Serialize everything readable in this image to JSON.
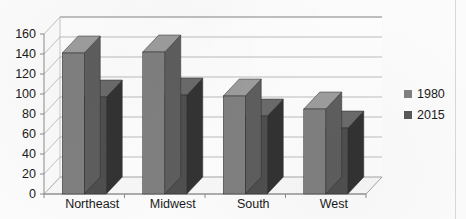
{
  "chart_data": {
    "type": "bar",
    "style": "3d-clustered-column",
    "title": "",
    "subtitle": "",
    "xlabel": "",
    "ylabel": "",
    "categories": [
      "Northeast",
      "Midwest",
      "South",
      "West"
    ],
    "series": [
      {
        "name": "1980",
        "color": "#808080",
        "values": [
          141,
          142,
          98,
          85
        ]
      },
      {
        "name": "2015",
        "color": "#595959",
        "values": [
          97,
          99,
          78,
          66
        ]
      }
    ],
    "ylim": [
      0,
      160
    ],
    "ytick_step": 20,
    "yticks": [
      0,
      20,
      40,
      60,
      80,
      100,
      120,
      140,
      160
    ],
    "ytick_labels": [
      "0",
      "20",
      "40",
      "60",
      "80",
      "100",
      "120",
      "140",
      "160"
    ],
    "grid": true,
    "grid_axis": "y",
    "legend_position": "right",
    "legend_entries": [
      "1980",
      "2015"
    ]
  },
  "colors": {
    "series_1980": "#808080",
    "series_1980_side": "#5e5e5e",
    "series_1980_top": "#9d9d9d",
    "series_2015": "#4f4f4f",
    "series_2015_side": "#333333",
    "series_2015_top": "#6b6b6b",
    "gridline": "#b0b0b0",
    "axis": "#8a8a8a",
    "floor": "#f2f2f2",
    "wall": "#fdfdfd",
    "text": "#1a1a1a",
    "background": "#fbfbfb"
  }
}
